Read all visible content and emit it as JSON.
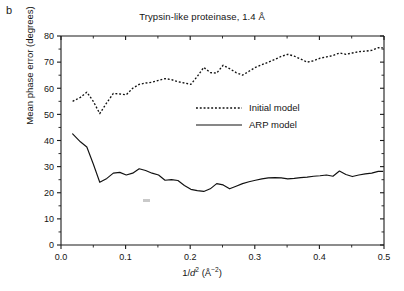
{
  "panel": {
    "label": "b"
  },
  "chart_data": {
    "type": "line",
    "title": "Trypsin-like proteinase, 1.4 Å",
    "xlabel": "1/d² (Å⁻²)",
    "ylabel": "Mean phase error (degrees)",
    "xlim": [
      0.0,
      0.5
    ],
    "ylim": [
      0,
      80
    ],
    "xticks": [
      0.0,
      0.1,
      0.2,
      0.3,
      0.4,
      0.5
    ],
    "xtick_labels": [
      "0.0",
      "0.1",
      "0.2",
      "0.3",
      "0.4",
      "0.5"
    ],
    "yticks": [
      0,
      10,
      20,
      30,
      40,
      50,
      60,
      70,
      80
    ],
    "ytick_labels": [
      "0",
      "10",
      "20",
      "30",
      "40",
      "50",
      "60",
      "70",
      "80"
    ],
    "grid": false,
    "legend_position": "center",
    "series": [
      {
        "name": "Initial model",
        "style": "dotted",
        "color": "#111111",
        "x": [
          0.018,
          0.03,
          0.04,
          0.05,
          0.06,
          0.071,
          0.081,
          0.091,
          0.101,
          0.111,
          0.121,
          0.131,
          0.141,
          0.151,
          0.161,
          0.171,
          0.181,
          0.191,
          0.201,
          0.211,
          0.221,
          0.231,
          0.241,
          0.251,
          0.261,
          0.271,
          0.281,
          0.291,
          0.301,
          0.311,
          0.321,
          0.331,
          0.341,
          0.351,
          0.361,
          0.371,
          0.381,
          0.391,
          0.401,
          0.411,
          0.421,
          0.431,
          0.441,
          0.451,
          0.461,
          0.471,
          0.481,
          0.491,
          0.498
        ],
        "y": [
          55.0,
          56.5,
          58.5,
          55.0,
          50.3,
          54.5,
          58.0,
          57.8,
          57.5,
          60.0,
          61.5,
          62.0,
          62.3,
          63.0,
          63.7,
          63.3,
          62.5,
          62.0,
          61.5,
          64.5,
          68.0,
          66.0,
          65.8,
          68.8,
          67.5,
          66.0,
          65.0,
          66.5,
          68.0,
          69.0,
          70.0,
          71.0,
          72.2,
          73.0,
          72.3,
          71.2,
          70.0,
          70.5,
          71.5,
          72.0,
          72.5,
          73.5,
          73.0,
          73.5,
          74.0,
          74.2,
          74.5,
          75.5,
          75.5
        ]
      },
      {
        "name": "ARP model",
        "style": "solid",
        "color": "#111111",
        "x": [
          0.018,
          0.03,
          0.04,
          0.05,
          0.06,
          0.071,
          0.081,
          0.091,
          0.101,
          0.111,
          0.121,
          0.131,
          0.141,
          0.151,
          0.161,
          0.171,
          0.181,
          0.191,
          0.201,
          0.211,
          0.221,
          0.231,
          0.241,
          0.251,
          0.261,
          0.271,
          0.281,
          0.291,
          0.301,
          0.311,
          0.321,
          0.331,
          0.341,
          0.351,
          0.361,
          0.371,
          0.381,
          0.391,
          0.401,
          0.411,
          0.421,
          0.431,
          0.441,
          0.451,
          0.461,
          0.471,
          0.481,
          0.491,
          0.498
        ],
        "y": [
          42.5,
          39.5,
          37.5,
          31.0,
          24.0,
          25.5,
          27.5,
          27.8,
          26.8,
          27.5,
          29.2,
          28.5,
          27.5,
          26.8,
          24.8,
          25.0,
          24.7,
          22.8,
          21.3,
          20.8,
          20.5,
          21.5,
          23.5,
          23.0,
          21.5,
          22.5,
          23.5,
          24.2,
          24.8,
          25.3,
          25.7,
          25.8,
          25.7,
          25.3,
          25.5,
          25.8,
          26.0,
          26.3,
          26.5,
          26.8,
          26.3,
          28.3,
          27.0,
          26.2,
          26.8,
          27.2,
          27.5,
          28.2,
          28.2
        ]
      }
    ]
  },
  "legend": {
    "items": [
      {
        "label": "Initial model",
        "style": "dotted"
      },
      {
        "label": "ARP model",
        "style": "solid"
      }
    ]
  }
}
